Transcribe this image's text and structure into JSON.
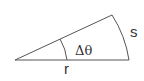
{
  "diagram": {
    "type": "circular-sector",
    "labels": {
      "angle": "Δθ",
      "arc_length": "s",
      "radius": "r"
    },
    "colors": {
      "stroke": "#555555",
      "text": "#333333",
      "background": "#ffffff"
    }
  }
}
